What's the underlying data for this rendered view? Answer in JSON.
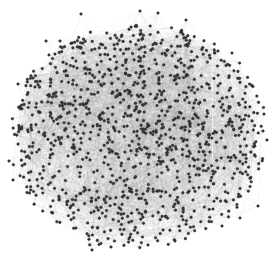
{
  "diagram": {
    "type": "network-graph",
    "layout": "force-directed",
    "canvas": {
      "width": 275,
      "height": 257,
      "background": "#ffffff"
    },
    "blob": {
      "center_x": 139,
      "center_y": 133,
      "radius_x": 128,
      "radius_y": 118,
      "top_flatten": 0.92
    },
    "nodes": {
      "count": 1100,
      "radius": 1.3,
      "color": "#3a3a3a",
      "outline": "#1e1e1e"
    },
    "edges": {
      "count": 5200,
      "color": "rgba(120,120,120,0.10)",
      "width": 0.5,
      "max_length": 95
    },
    "highlight_line": {
      "x": 212,
      "y_top": 40,
      "y_bottom": 228,
      "color": "rgba(255,255,255,0.55)"
    },
    "outliers": [
      {
        "x": 81,
        "y": 14
      },
      {
        "x": 140,
        "y": 11
      },
      {
        "x": 158,
        "y": 13
      },
      {
        "x": 186,
        "y": 20
      },
      {
        "x": 46,
        "y": 41
      },
      {
        "x": 60,
        "y": 41
      },
      {
        "x": 18,
        "y": 84
      },
      {
        "x": 33,
        "y": 78
      },
      {
        "x": 218,
        "y": 51
      },
      {
        "x": 232,
        "y": 53
      },
      {
        "x": 263,
        "y": 131
      },
      {
        "x": 267,
        "y": 140
      },
      {
        "x": 9,
        "y": 161
      },
      {
        "x": 13,
        "y": 180
      },
      {
        "x": 92,
        "y": 250
      },
      {
        "x": 111,
        "y": 247
      },
      {
        "x": 148,
        "y": 245
      },
      {
        "x": 175,
        "y": 241
      },
      {
        "x": 222,
        "y": 226
      },
      {
        "x": 240,
        "y": 218
      },
      {
        "x": 258,
        "y": 206
      }
    ],
    "seed": 1337
  }
}
